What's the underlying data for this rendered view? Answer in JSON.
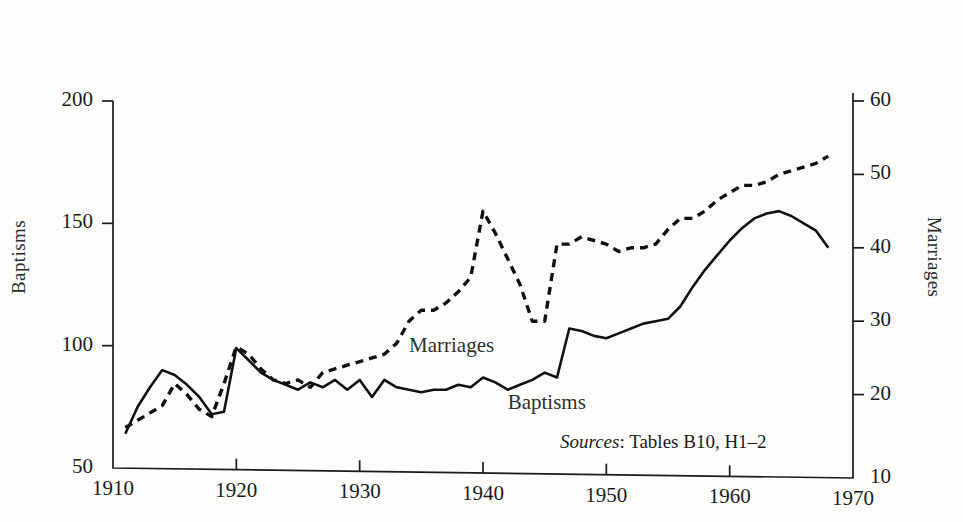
{
  "figure": {
    "left_axis_title": "Baptisms",
    "right_axis_title": "Marriages",
    "source_note_label": "Sources",
    "source_note_colon": ":",
    "source_note_text": " Tables B10, H1–2"
  },
  "labels": {
    "marriages_inplot": "Marriages",
    "baptisms_inplot": "Baptisms"
  },
  "chart_data": {
    "type": "line",
    "title": "",
    "subtitle": "",
    "xlabel": "",
    "ylabel": "Baptisms",
    "y2label": "Marriages",
    "xlim": [
      1910,
      1970
    ],
    "ylim": [
      50,
      200
    ],
    "y2lim": [
      10,
      60
    ],
    "grid": false,
    "legend": "inline-annotations",
    "xticks": [
      "1910",
      "1920",
      "1930",
      "1940",
      "1950",
      "1960",
      "1970"
    ],
    "yticks_left": [
      "50",
      "100",
      "150",
      "200"
    ],
    "yticks_right": [
      "10",
      "20",
      "30",
      "40",
      "50",
      "60"
    ],
    "annotations": [
      {
        "text": "Marriages",
        "x": 1934,
        "y2": 26.5
      },
      {
        "text": "Baptisms",
        "x": 1942,
        "y": 76
      },
      {
        "text": "Sources: Tables B10, H1–2",
        "x": 1958,
        "y": 57
      }
    ],
    "series": [
      {
        "name": "Baptisms",
        "axis": "left",
        "style": "solid",
        "color": "#111111",
        "x": [
          1911,
          1912,
          1913,
          1914,
          1915,
          1916,
          1917,
          1918,
          1919,
          1920,
          1921,
          1922,
          1923,
          1924,
          1925,
          1926,
          1927,
          1928,
          1929,
          1930,
          1931,
          1932,
          1933,
          1934,
          1935,
          1936,
          1937,
          1938,
          1939,
          1940,
          1941,
          1942,
          1943,
          1944,
          1945,
          1946,
          1947,
          1948,
          1949,
          1950,
          1951,
          1952,
          1953,
          1954,
          1955,
          1956,
          1957,
          1958,
          1959,
          1960,
          1961,
          1962,
          1963,
          1964,
          1965,
          1966,
          1967,
          1968
        ],
        "values": [
          64,
          75,
          83,
          90,
          88,
          84,
          79,
          72,
          73,
          99,
          94,
          89,
          86,
          84,
          82,
          85,
          83,
          86,
          82,
          86,
          79,
          86,
          83,
          82,
          81,
          82,
          82,
          84,
          83,
          87,
          85,
          82,
          84,
          86,
          89,
          87,
          107,
          106,
          104,
          103,
          105,
          107,
          109,
          110,
          111,
          116,
          124,
          131,
          137,
          143,
          148,
          152,
          154,
          155,
          153,
          150,
          147,
          140
        ]
      },
      {
        "name": "Marriages",
        "axis": "right",
        "style": "dashed",
        "color": "#111111",
        "x": [
          1911,
          1912,
          1913,
          1914,
          1915,
          1916,
          1917,
          1918,
          1919,
          1920,
          1921,
          1922,
          1923,
          1924,
          1925,
          1926,
          1927,
          1928,
          1929,
          1930,
          1931,
          1932,
          1933,
          1934,
          1935,
          1936,
          1937,
          1938,
          1939,
          1940,
          1941,
          1942,
          1943,
          1944,
          1945,
          1946,
          1947,
          1948,
          1949,
          1950,
          1951,
          1952,
          1953,
          1954,
          1955,
          1956,
          1957,
          1958,
          1959,
          1960,
          1961,
          1962,
          1963,
          1964,
          1965,
          1966,
          1967,
          1968
        ],
        "values": [
          15.5,
          16.5,
          17.5,
          18.5,
          21.5,
          20.0,
          18.0,
          17.0,
          21.5,
          26.5,
          25.5,
          23.5,
          22.0,
          21.5,
          22.0,
          21.0,
          23.0,
          23.5,
          24.0,
          24.5,
          25.0,
          25.5,
          27.0,
          30.0,
          31.5,
          31.5,
          32.5,
          34.0,
          36.0,
          45.0,
          42.0,
          38.5,
          35.0,
          30.0,
          30.0,
          40.5,
          40.5,
          41.5,
          41.0,
          40.5,
          39.5,
          40.0,
          40.0,
          40.5,
          42.5,
          44.0,
          44.0,
          45.0,
          46.5,
          47.5,
          48.5,
          48.5,
          49.0,
          50.0,
          50.5,
          51.0,
          51.5,
          52.5
        ]
      }
    ]
  }
}
